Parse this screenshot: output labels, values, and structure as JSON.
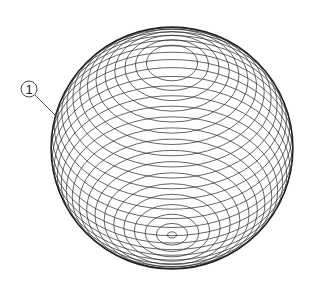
{
  "diagram": {
    "sphere": {
      "cx": 172,
      "cy": 148,
      "r": 121,
      "outline_color": "#222222"
    },
    "pole": {
      "cx": 172,
      "cy": 61
    },
    "contour_count": 32,
    "line_color": "#333333",
    "callouts": [
      {
        "id": "1",
        "label": "①",
        "label_x": 29,
        "label_y": 89,
        "target_x": 58,
        "target_y": 118
      }
    ]
  }
}
